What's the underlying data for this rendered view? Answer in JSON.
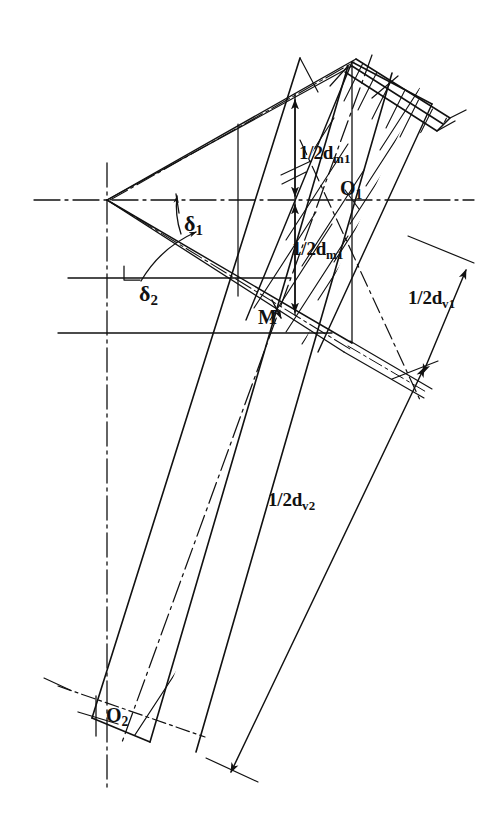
{
  "figure": {
    "kind": "engineering-line-drawing",
    "background_color": "#ffffff",
    "ink_color": "#111111"
  },
  "labels": {
    "dim_dm1_upper": {
      "text": "1/2d",
      "sub": "m1"
    },
    "dim_dm1_lower": {
      "text": "1/2d",
      "sub": "m1"
    },
    "dim_dv1": {
      "text": "1/2d",
      "sub": "v1"
    },
    "dim_dv2": {
      "text": "1/2d",
      "sub": "v2"
    },
    "point_O1": {
      "text": "O",
      "sub": "1"
    },
    "point_O2": {
      "text": "O",
      "sub": "2"
    },
    "point_M": {
      "text": "M",
      "sub": ""
    },
    "angle_delta1": {
      "text": "δ",
      "sub": "1"
    },
    "angle_delta2": {
      "text": "δ",
      "sub": "2"
    }
  },
  "annotations": [
    {
      "name": "dimension-half-dm1-upper",
      "label_key": "dim_dm1_upper",
      "x": 299,
      "y": 143,
      "style": "lbl-dim"
    },
    {
      "name": "dimension-half-dm1-lower",
      "label_key": "dim_dm1_lower",
      "x": 292,
      "y": 239,
      "style": "lbl-dim"
    },
    {
      "name": "dimension-half-dv1",
      "label_key": "dim_dv1",
      "x": 408,
      "y": 288,
      "style": "lbl-dim"
    },
    {
      "name": "dimension-half-dv2",
      "label_key": "dim_dv2",
      "x": 268,
      "y": 490,
      "style": "lbl-dim"
    },
    {
      "name": "point-label-O1",
      "label_key": "point_O1",
      "x": 340,
      "y": 178,
      "style": "lbl-pt"
    },
    {
      "name": "point-label-O2",
      "label_key": "point_O2",
      "x": 106,
      "y": 705,
      "style": "lbl-pt"
    },
    {
      "name": "point-label-M",
      "label_key": "point_M",
      "x": 258,
      "y": 307,
      "style": "lbl-pt"
    },
    {
      "name": "angle-label-delta1",
      "label_key": "angle_delta1",
      "x": 184,
      "y": 213,
      "style": "lbl-ang"
    },
    {
      "name": "angle-label-delta2",
      "label_key": "angle_delta2",
      "x": 139,
      "y": 283,
      "style": "lbl-ang"
    }
  ],
  "geometry_notes": {
    "apex_vertex": "cone apex at left on the horizontal axis",
    "axes": "dash-dot vertical axis and dash-dot horizontal axis through apex",
    "hatched_bands": "two cross-hatched tooth/rim bands inclined to lower-left",
    "dimension_lines": "double-arrow dimension lines for half pitch and outer cone distances"
  }
}
